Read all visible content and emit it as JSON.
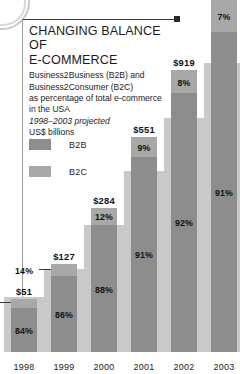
{
  "header": {
    "title": "CHANGING BALANCE OF\nE-COMMERCE",
    "subtitle": "Business2Business (B2B) and\nBusiness2Consumer (B2C)\nas percentage of total e-commerce\nin the USA",
    "projection_note": "1998–2003 projected",
    "units": "US$ billions"
  },
  "legend": {
    "position": "top-left",
    "items": [
      {
        "label": "B2B",
        "color": "#8d8d8d"
      },
      {
        "label": "B2C",
        "color": "#a8a8a8"
      }
    ]
  },
  "colors": {
    "b2b": "#8d8d8d",
    "b2c": "#a8a8a8",
    "backdrop": "#c9c9c9",
    "text": "#1c1c1c",
    "rule": "#9a9a9a"
  },
  "chart_data": {
    "type": "bar",
    "title": "CHANGING BALANCE OF E-COMMERCE",
    "subtitle": "Business2Business (B2B) and Business2Consumer (B2C) as percentage of total e-commerce in the USA",
    "xlabel": "",
    "ylabel": "US$ billions",
    "stacked": true,
    "stack_mode": "percentage-of-total",
    "categories": [
      "1998",
      "1999",
      "2000",
      "2001",
      "2002",
      "2003"
    ],
    "totals": [
      51,
      127,
      284,
      551,
      919,
      1500
    ],
    "total_labels": [
      "$51",
      "$127",
      "$284",
      "$551",
      "$919",
      ""
    ],
    "series": [
      {
        "name": "B2B",
        "values": [
          84,
          86,
          88,
          91,
          92,
          91
        ],
        "value_labels": [
          "84%",
          "86%",
          "88%",
          "91%",
          "92%",
          "91%"
        ]
      },
      {
        "name": "B2C",
        "values": [
          16,
          14,
          12,
          9,
          8,
          7
        ],
        "value_labels": [
          "16%",
          "14%",
          "12%",
          "9%",
          "8%",
          "7%"
        ]
      }
    ],
    "legend_entries": [
      "B2B",
      "B2C"
    ],
    "grid": false,
    "ylim": [
      0,
      1500
    ]
  },
  "bars": [
    {
      "year": "1998",
      "total_label": "$51",
      "b2b_label": "84%",
      "b2c_label": "16%",
      "b2c_outside": true,
      "height_pct": 15,
      "b2b_share": 84
    },
    {
      "year": "1999",
      "total_label": "$127",
      "b2b_label": "86%",
      "b2c_label": "14%",
      "b2c_outside": true,
      "height_pct": 25,
      "b2b_share": 86
    },
    {
      "year": "2000",
      "total_label": "$284",
      "b2b_label": "88%",
      "b2c_label": "12%",
      "b2c_outside": false,
      "height_pct": 41,
      "b2b_share": 88
    },
    {
      "year": "2001",
      "total_label": "$551",
      "b2b_label": "91%",
      "b2c_label": "9%",
      "b2c_outside": false,
      "height_pct": 61,
      "b2b_share": 91
    },
    {
      "year": "2002",
      "total_label": "$919",
      "b2b_label": "92%",
      "b2c_label": "8%",
      "b2c_outside": false,
      "height_pct": 80,
      "b2b_share": 92
    },
    {
      "year": "2003",
      "total_label": "",
      "b2b_label": "91%",
      "b2c_label": "7%",
      "b2c_outside": false,
      "height_pct": 100,
      "b2b_share": 91
    }
  ]
}
